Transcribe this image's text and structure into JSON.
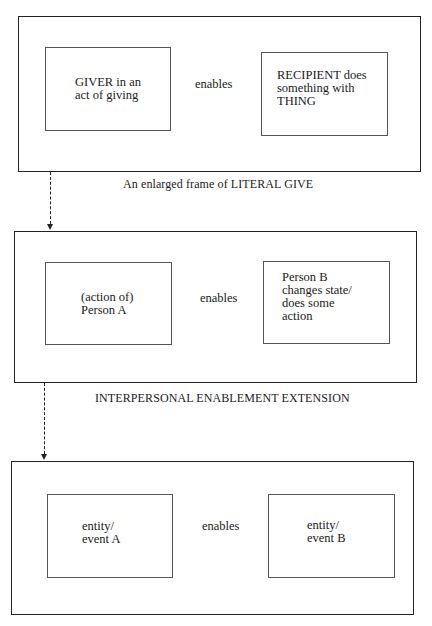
{
  "diagram": {
    "frames": [
      {
        "left_box": "GIVER in an\nact of giving",
        "relation": "enables",
        "right_box": "RECIPIENT does\nsomething with\nTHING",
        "caption": "An enlarged frame of LITERAL GIVE"
      },
      {
        "left_box": "(action of)\nPerson A",
        "relation": "enables",
        "right_box": "Person B\nchanges state/\ndoes some\naction",
        "caption": "INTERPERSONAL ENABLEMENT EXTENSION"
      },
      {
        "left_box": "entity/\nevent A",
        "relation": "enables",
        "right_box": "entity/\nevent B",
        "caption": ""
      }
    ],
    "connectors": [
      {
        "from": "frame-1",
        "to": "frame-2",
        "style": "dashed-arrow"
      },
      {
        "from": "frame-2",
        "to": "frame-3",
        "style": "dashed-arrow"
      }
    ]
  }
}
